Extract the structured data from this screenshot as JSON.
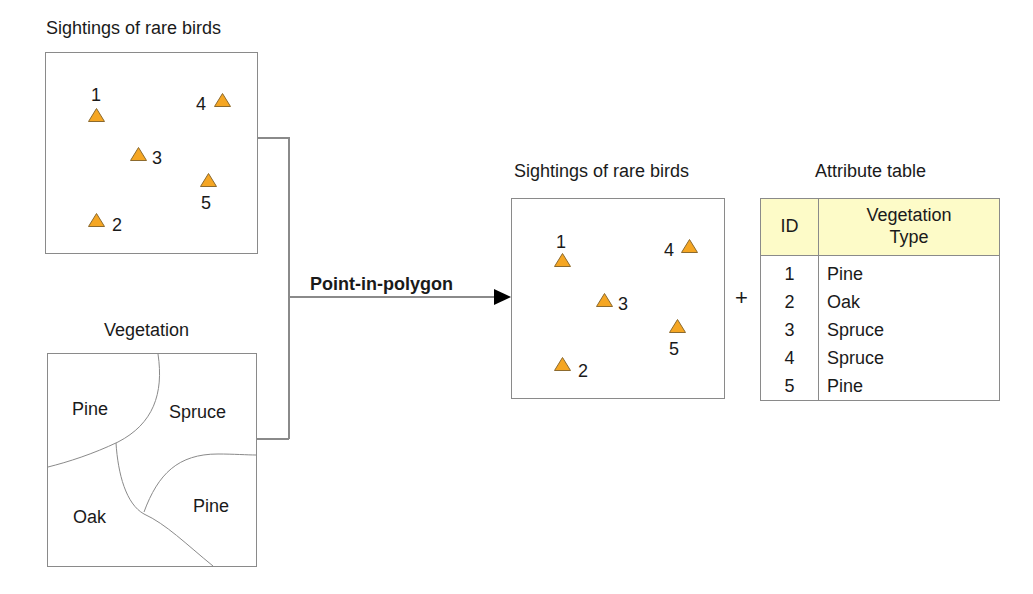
{
  "inputs": {
    "points_layer": {
      "title": "Sightings of rare birds",
      "symbol_color": "#f5a623",
      "symbol_stroke": "#8c6a2e",
      "points": [
        {
          "id": "1",
          "x": 50,
          "y": 62,
          "label_pos": "above"
        },
        {
          "id": "2",
          "x": 50,
          "y": 167,
          "label_pos": "right"
        },
        {
          "id": "3",
          "x": 92,
          "y": 101,
          "label_pos": "right"
        },
        {
          "id": "4",
          "x": 176,
          "y": 47,
          "label_pos": "left"
        },
        {
          "id": "5",
          "x": 162,
          "y": 128,
          "label_pos": "below"
        }
      ]
    },
    "polygon_layer": {
      "title": "Vegetation",
      "regions": [
        {
          "name": "Pine",
          "position": "top-left"
        },
        {
          "name": "Spruce",
          "position": "top-right"
        },
        {
          "name": "Oak",
          "position": "bottom-left"
        },
        {
          "name": "Pine",
          "position": "bottom-right"
        }
      ]
    }
  },
  "operation": {
    "label": "Point-in-polygon",
    "plus_sign": "+"
  },
  "output": {
    "points_layer": {
      "title": "Sightings of rare birds"
    },
    "attribute_table": {
      "title": "Attribute table",
      "header_color": "#fdfbc8",
      "columns": [
        "ID",
        "Vegetation Type"
      ],
      "column_header_lines": {
        "id": "ID",
        "veg_line1": "Vegetation",
        "veg_line2": "Type"
      },
      "rows": [
        {
          "id": "1",
          "vegetation": "Pine"
        },
        {
          "id": "2",
          "vegetation": "Oak"
        },
        {
          "id": "3",
          "vegetation": "Spruce"
        },
        {
          "id": "4",
          "vegetation": "Spruce"
        },
        {
          "id": "5",
          "vegetation": "Pine"
        }
      ]
    }
  }
}
